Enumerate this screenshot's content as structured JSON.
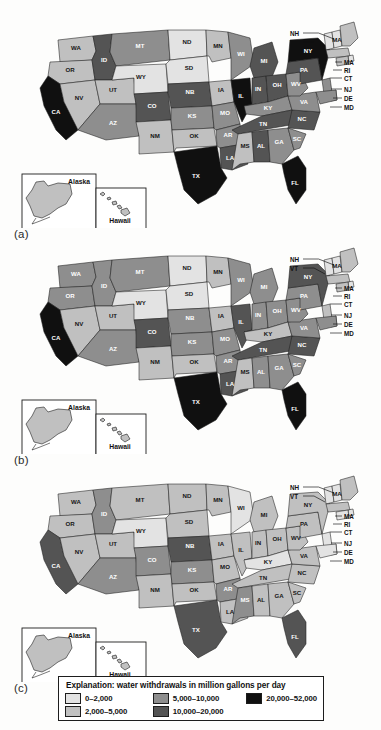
{
  "figure": {
    "panels": [
      {
        "id": "a",
        "label": "(a)"
      },
      {
        "id": "b",
        "label": "(b)"
      },
      {
        "id": "c",
        "label": "(c)"
      }
    ]
  },
  "legend": {
    "title": "Explanation: water withdrawals in million gallons per day",
    "items": [
      {
        "label": "0–2,000",
        "color": "#e3e3e3"
      },
      {
        "label": "2,000–5,000",
        "color": "#c0c0c0"
      },
      {
        "label": "5,000–10,000",
        "color": "#8e8e8e"
      },
      {
        "label": "10,000–20,000",
        "color": "#545454"
      },
      {
        "label": "20,000–52,000",
        "color": "#101010"
      }
    ],
    "columns": [
      [
        0,
        1
      ],
      [
        2,
        3
      ],
      [
        4
      ]
    ]
  },
  "insets": {
    "alaska_label": "Alaska",
    "hawaii_label": "Hawaii"
  },
  "callouts": {
    "upper": [
      "NH",
      "VT"
    ],
    "right": [
      "MA",
      "RI",
      "CT",
      "NJ",
      "DE",
      "MD"
    ],
    "on_map": [
      "MA"
    ]
  },
  "state_labels": [
    "WA",
    "OR",
    "ID",
    "MT",
    "ND",
    "MN",
    "WI",
    "MI",
    "NY",
    "MA",
    "NV",
    "UT",
    "WY",
    "SD",
    "IA",
    "IL",
    "IN",
    "OH",
    "PA",
    "CA",
    "AZ",
    "NM",
    "CO",
    "NB",
    "KS",
    "MO",
    "KY",
    "WV",
    "VA",
    "NC",
    "OK",
    "AR",
    "TN",
    "SC",
    "TX",
    "LA",
    "MS",
    "AL",
    "GA",
    "FL"
  ],
  "chart_data": {
    "type": "choropleth-map-series",
    "title": "Explanation: water withdrawals in million gallons per day",
    "unit": "million gallons per day",
    "classes": [
      {
        "range": "0–2,000",
        "min": 0,
        "max": 2000,
        "color": "#e3e3e3"
      },
      {
        "range": "2,000–5,000",
        "min": 2000,
        "max": 5000,
        "color": "#c0c0c0"
      },
      {
        "range": "5,000–10,000",
        "min": 5000,
        "max": 10000,
        "color": "#8e8e8e"
      },
      {
        "range": "10,000–20,000",
        "min": 10000,
        "max": 20000,
        "color": "#545454"
      },
      {
        "range": "20,000–52,000",
        "min": 20000,
        "max": 52000,
        "color": "#101010"
      }
    ],
    "panels": [
      {
        "id": "a",
        "label": "(a)",
        "values": {
          "WA": "2,000–5,000",
          "OR": "2,000–5,000",
          "CA": "20,000–52,000",
          "ID": "10,000–20,000",
          "NV": "2,000–5,000",
          "UT": "2,000–5,000",
          "AZ": "5,000–10,000",
          "MT": "5,000–10,000",
          "WY": "0–2,000",
          "CO": "10,000–20,000",
          "NM": "2,000–5,000",
          "ND": "0–2,000",
          "SD": "0–2,000",
          "NB": "10,000–20,000",
          "KS": "5,000–10,000",
          "OK": "2,000–5,000",
          "TX": "20,000–52,000",
          "MN": "2,000–5,000",
          "IA": "2,000–5,000",
          "MO": "5,000–10,000",
          "AR": "5,000–10,000",
          "LA": "10,000–20,000",
          "WI": "5,000–10,000",
          "IL": "20,000–52,000",
          "MI": "10,000–20,000",
          "IN": "10,000–20,000",
          "OH": "10,000–20,000",
          "KY": "5,000–10,000",
          "TN": "10,000–20,000",
          "MS": "2,000–5,000",
          "AL": "10,000–20,000",
          "GA": "5,000–10,000",
          "FL": "20,000–52,000",
          "SC": "5,000–10,000",
          "NC": "10,000–20,000",
          "VA": "5,000–10,000",
          "WV": "5,000–10,000",
          "PA": "10,000–20,000",
          "NY": "20,000–52,000",
          "MD": "5,000–10,000",
          "DE": "0–2,000",
          "NJ": "5,000–10,000",
          "CT": "2,000–5,000",
          "RI": "0–2,000",
          "MA": "2,000–5,000",
          "VT": "0–2,000",
          "NH": "0–2,000",
          "ME": "2,000–5,000",
          "AK": "2,000–5,000",
          "HI": "2,000–5,000"
        }
      },
      {
        "id": "b",
        "label": "(b)",
        "values": {
          "WA": "5,000–10,000",
          "OR": "5,000–10,000",
          "CA": "20,000–52,000",
          "ID": "5,000–10,000",
          "NV": "2,000–5,000",
          "UT": "2,000–5,000",
          "AZ": "5,000–10,000",
          "MT": "5,000–10,000",
          "WY": "0–2,000",
          "CO": "10,000–20,000",
          "NM": "2,000–5,000",
          "ND": "0–2,000",
          "SD": "0–2,000",
          "NB": "5,000–10,000",
          "KS": "5,000–10,000",
          "OK": "2,000–5,000",
          "TX": "20,000–52,000",
          "MN": "2,000–5,000",
          "IA": "2,000–5,000",
          "MO": "5,000–10,000",
          "AR": "5,000–10,000",
          "LA": "10,000–20,000",
          "WI": "5,000–10,000",
          "IL": "10,000–20,000",
          "MI": "5,000–10,000",
          "IN": "5,000–10,000",
          "OH": "5,000–10,000",
          "KY": "2,000–5,000",
          "TN": "10,000–20,000",
          "MS": "2,000–5,000",
          "AL": "5,000–10,000",
          "GA": "5,000–10,000",
          "FL": "20,000–52,000",
          "SC": "5,000–10,000",
          "NC": "10,000–20,000",
          "VA": "5,000–10,000",
          "WV": "5,000–10,000",
          "PA": "5,000–10,000",
          "NY": "10,000–20,000",
          "MD": "5,000–10,000",
          "DE": "0–2,000",
          "NJ": "2,000–5,000",
          "CT": "2,000–5,000",
          "RI": "0–2,000",
          "MA": "2,000–5,000",
          "VT": "0–2,000",
          "NH": "0–2,000",
          "ME": "2,000–5,000",
          "AK": "2,000–5,000",
          "HI": "2,000–5,000"
        }
      },
      {
        "id": "c",
        "label": "(c)",
        "values": {
          "WA": "2,000–5,000",
          "OR": "2,000–5,000",
          "CA": "10,000–20,000",
          "ID": "5,000–10,000",
          "NV": "2,000–5,000",
          "UT": "2,000–5,000",
          "AZ": "5,000–10,000",
          "MT": "2,000–5,000",
          "WY": "0–2,000",
          "CO": "5,000–10,000",
          "NM": "2,000–5,000",
          "ND": "2,000–5,000",
          "SD": "2,000–5,000",
          "NB": "10,000–20,000",
          "KS": "5,000–10,000",
          "OK": "2,000–5,000",
          "TX": "10,000–20,000",
          "MN": "2,000–5,000",
          "IA": "2,000–5,000",
          "MO": "2,000–5,000",
          "AR": "5,000–10,000",
          "LA": "2,000–5,000",
          "WI": "0–2,000",
          "IL": "2,000–5,000",
          "MI": "2,000–5,000",
          "IN": "2,000–5,000",
          "OH": "2,000–5,000",
          "KY": "0–2,000",
          "TN": "2,000–5,000",
          "MS": "5,000–10,000",
          "AL": "2,000–5,000",
          "GA": "2,000–5,000",
          "FL": "10,000–20,000",
          "SC": "2,000–5,000",
          "NC": "2,000–5,000",
          "VA": "2,000–5,000",
          "WV": "2,000–5,000",
          "PA": "2,000–5,000",
          "NY": "2,000–5,000",
          "MD": "0–2,000",
          "DE": "0–2,000",
          "NJ": "0–2,000",
          "CT": "0–2,000",
          "RI": "0–2,000",
          "MA": "2,000–5,000",
          "VT": "0–2,000",
          "NH": "0–2,000",
          "ME": "2,000–5,000",
          "AK": "2,000–5,000",
          "HI": "2,000–5,000"
        }
      }
    ]
  }
}
